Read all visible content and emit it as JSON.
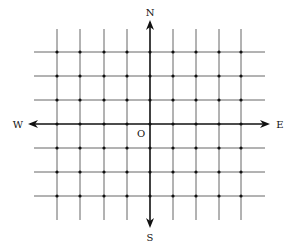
{
  "diagram": {
    "labels": {
      "north": "N",
      "south": "S",
      "east": "E",
      "west": "W",
      "origin": "O"
    },
    "grid": {
      "vertical_x": [
        57,
        80,
        104,
        127,
        150,
        173,
        196,
        219,
        241
      ],
      "horizontal_y": [
        52,
        76,
        100,
        124,
        148,
        172,
        196
      ],
      "v_extent": [
        29,
        220
      ],
      "h_extent": [
        34,
        265
      ]
    },
    "axis_x": 150,
    "axis_y": 124,
    "colors": {
      "grid": "#555555",
      "axis": "#111111",
      "dot": "#111111"
    }
  }
}
